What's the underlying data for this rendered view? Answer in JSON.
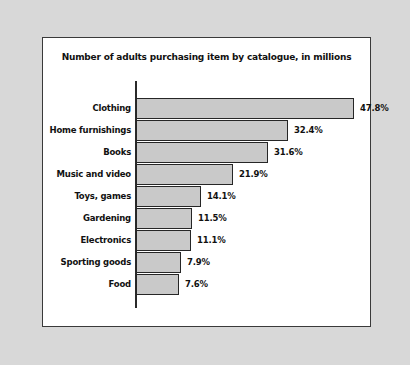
{
  "chart_data": {
    "type": "bar",
    "orientation": "horizontal",
    "title": "Number of adults purchasing item by catalogue, in millions",
    "xlabel": "",
    "ylabel": "",
    "grid": false,
    "legend": null,
    "value_suffix": "%",
    "categories": [
      "Clothing",
      "Home furnishings",
      "Books",
      "Music and video",
      "Toys, games",
      "Gardening",
      "Electronics",
      "Sporting goods",
      "Food"
    ],
    "values": [
      47.8,
      32.4,
      31.6,
      21.9,
      14.1,
      11.5,
      11.1,
      7.9,
      7.6
    ],
    "value_labels": [
      "47.8%",
      "32.4%",
      "31.6%",
      "21.9%",
      "14.1%",
      "11.5%",
      "11.1%",
      "7.9%",
      "7.6%"
    ],
    "bar_pixel_lengths": [
      218,
      152,
      132,
      97,
      65,
      56,
      55,
      45,
      43
    ],
    "xlim": [
      0,
      47.8
    ],
    "colors": {
      "bar_fill": "#c9c9c9",
      "bar_outline": "#262626",
      "axis": "#2a2a2a",
      "text": "#111111",
      "panel_background": "#ffffff",
      "figure_background": "#d8d8d8",
      "panel_border": "#3a3a3a"
    }
  }
}
